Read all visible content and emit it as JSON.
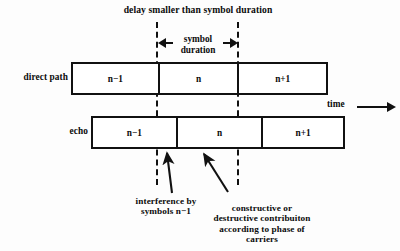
{
  "figure": {
    "type": "diagram",
    "title": "delay smaller than symbol duration",
    "time_axis_label": "time",
    "measure": {
      "label_line1": "symbol",
      "label_line2": "duration",
      "left_arrow_icon": "arrow-left-icon",
      "right_arrow_icon": "arrow-right-icon"
    },
    "rows": [
      {
        "name": "direct-path",
        "label": "direct path",
        "cells": [
          {
            "label": "n−1"
          },
          {
            "label": "n"
          },
          {
            "label": "n+1"
          }
        ]
      },
      {
        "name": "echo",
        "label": "echo",
        "cells": [
          {
            "label": "n−1"
          },
          {
            "label": "n"
          },
          {
            "label": "n+1"
          }
        ]
      }
    ],
    "annotations": [
      {
        "name": "interference-annotation",
        "line1": "interference by",
        "line2": "symbols n−1"
      },
      {
        "name": "contribution-annotation",
        "line1": "constructive or",
        "line2": "destructive contribuiton",
        "line3": "according to phase of",
        "line4": "carriers"
      }
    ],
    "colors": {
      "background": "#fdfdfd",
      "stroke": "#111111",
      "text": "#0b0b0b",
      "box_fill": "#ffffff"
    }
  }
}
